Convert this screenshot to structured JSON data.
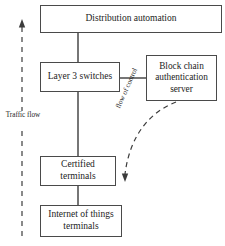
{
  "diagram": {
    "canvas": {
      "width": 225,
      "height": 246
    },
    "style": {
      "box_border_color": "#4a4a4a",
      "line_color": "#3c3c3c",
      "text_color": "#1c1c1c",
      "background": "#ffffff"
    },
    "nodes": [
      {
        "id": "distribution_automation",
        "label": "Distribution automation",
        "shape": "rectangle"
      },
      {
        "id": "layer3_switches",
        "label": "Layer 3 switches",
        "shape": "rectangle"
      },
      {
        "id": "blockchain_server",
        "label": "Block chain\nauthentication\nserver",
        "shape": "rectangle"
      },
      {
        "id": "certified_terminals",
        "label": "Certified\nterminals",
        "shape": "rectangle"
      },
      {
        "id": "iot_terminals",
        "label": "Internet of things\nterminals",
        "shape": "rectangle"
      }
    ],
    "edges": [
      {
        "id": "distribution_to_layer3",
        "from": "distribution_automation",
        "to": "layer3_switches",
        "style": "solid",
        "arrow": "none"
      },
      {
        "id": "layer3_to_blockchain",
        "from": "layer3_switches",
        "to": "blockchain_server",
        "style": "solid",
        "arrow": "none"
      },
      {
        "id": "layer3_to_certified",
        "from": "layer3_switches",
        "to": "certified_terminals",
        "style": "solid",
        "arrow": "none"
      },
      {
        "id": "certified_to_iot",
        "from": "certified_terminals",
        "to": "iot_terminals",
        "style": "solid",
        "arrow": "none"
      },
      {
        "id": "flow_of_control_edge",
        "from": "blockchain_server",
        "to": "certified_terminals",
        "style": "dashed-curved",
        "arrow": "down",
        "label": "flow of control"
      },
      {
        "id": "traffic_flow_edge",
        "from": "iot_terminals",
        "to": "distribution_automation",
        "style": "dashed-vertical",
        "arrow": "up",
        "label": "Traffic flow"
      }
    ],
    "labels": {
      "traffic_flow": "Traffic flow",
      "flow_of_control": "flow of control"
    }
  }
}
